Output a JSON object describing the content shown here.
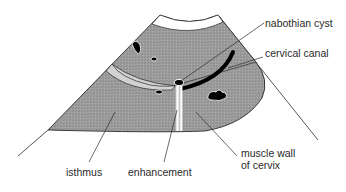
{
  "diagram": {
    "colors": {
      "tissue": "#9a9a9a",
      "light_region": "#d2d2d2",
      "outline": "#2b2b2b",
      "lumen": "#000000",
      "background": "#ffffff"
    },
    "labels": {
      "nabothian_cyst": "nabothian cyst",
      "cervical_canal": "cervical canal",
      "isthmus": "isthmus",
      "enhancement": "enhancement",
      "muscle_wall": "muscle wall\nof cervix"
    }
  }
}
